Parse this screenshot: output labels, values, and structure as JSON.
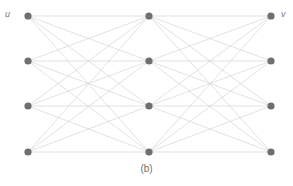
{
  "figure": {
    "caption": "(b)",
    "background_color": "#ffffff",
    "labels": {
      "left": "u",
      "right": "v",
      "label_color": "#7a7a7a"
    }
  },
  "chart_data": {
    "type": "diagram",
    "subtype": "layered-complete-bipartite-graph",
    "title": "(b)",
    "node_color": "#6f6f6f",
    "node_radius": 3.6,
    "edge_color": "#cfcfcf",
    "edge_width": 0.6,
    "layers": [
      {
        "name": "u",
        "x": 28,
        "nodes": [
          {
            "id": "u1",
            "x": 28,
            "y": 16
          },
          {
            "id": "u2",
            "x": 28,
            "y": 61
          },
          {
            "id": "u3",
            "x": 28,
            "y": 106
          },
          {
            "id": "u4",
            "x": 28,
            "y": 152
          }
        ]
      },
      {
        "name": "mid",
        "x": 149,
        "nodes": [
          {
            "id": "m1",
            "x": 149,
            "y": 16
          },
          {
            "id": "m2",
            "x": 149,
            "y": 61
          },
          {
            "id": "m3",
            "x": 149,
            "y": 106
          },
          {
            "id": "m4",
            "x": 149,
            "y": 152
          }
        ]
      },
      {
        "name": "v",
        "x": 271,
        "nodes": [
          {
            "id": "v1",
            "x": 271,
            "y": 16
          },
          {
            "id": "v2",
            "x": 271,
            "y": 61
          },
          {
            "id": "v3",
            "x": 271,
            "y": 106
          },
          {
            "id": "v4",
            "x": 271,
            "y": 152
          }
        ]
      }
    ],
    "edges": [
      {
        "from": "u1",
        "to": "m1"
      },
      {
        "from": "u1",
        "to": "m2"
      },
      {
        "from": "u1",
        "to": "m3"
      },
      {
        "from": "u1",
        "to": "m4"
      },
      {
        "from": "u2",
        "to": "m1"
      },
      {
        "from": "u2",
        "to": "m2"
      },
      {
        "from": "u2",
        "to": "m3"
      },
      {
        "from": "u2",
        "to": "m4"
      },
      {
        "from": "u3",
        "to": "m1"
      },
      {
        "from": "u3",
        "to": "m2"
      },
      {
        "from": "u3",
        "to": "m3"
      },
      {
        "from": "u3",
        "to": "m4"
      },
      {
        "from": "u4",
        "to": "m1"
      },
      {
        "from": "u4",
        "to": "m2"
      },
      {
        "from": "u4",
        "to": "m3"
      },
      {
        "from": "u4",
        "to": "m4"
      },
      {
        "from": "m1",
        "to": "v1"
      },
      {
        "from": "m1",
        "to": "v2"
      },
      {
        "from": "m1",
        "to": "v3"
      },
      {
        "from": "m1",
        "to": "v4"
      },
      {
        "from": "m2",
        "to": "v1"
      },
      {
        "from": "m2",
        "to": "v2"
      },
      {
        "from": "m2",
        "to": "v3"
      },
      {
        "from": "m2",
        "to": "v4"
      },
      {
        "from": "m3",
        "to": "v1"
      },
      {
        "from": "m3",
        "to": "v2"
      },
      {
        "from": "m3",
        "to": "v3"
      },
      {
        "from": "m3",
        "to": "v4"
      },
      {
        "from": "m4",
        "to": "v1"
      },
      {
        "from": "m4",
        "to": "v2"
      },
      {
        "from": "m4",
        "to": "v3"
      },
      {
        "from": "m4",
        "to": "v4"
      }
    ]
  }
}
